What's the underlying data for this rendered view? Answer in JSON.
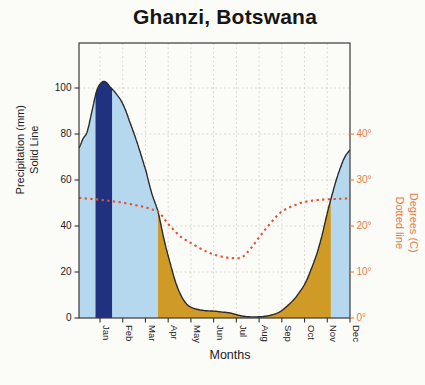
{
  "page": {
    "title": "Ghanzi, Botswana"
  },
  "axes": {
    "left_label_line1": "Precipitation (mm)",
    "left_label_line2": "Solid Line",
    "right_label_line1": "Degrees (C)",
    "right_label_line2": "Dotted line",
    "x_label": "Months"
  },
  "chart_data": {
    "type": "line",
    "title": "Ghanzi, Botswana",
    "subtitle": "Climograph: solid line / blue-gold area = precipitation, dotted line = temperature",
    "categories": [
      "Jan",
      "Feb",
      "Mar",
      "Apr",
      "May",
      "Jun",
      "Jul",
      "Aug",
      "Sep",
      "Oct",
      "Nov",
      "Dec"
    ],
    "series": [
      {
        "name": "Precipitation (mm)",
        "style": "solid-area",
        "values": [
          102,
          93,
          64,
          25,
          4,
          3,
          1,
          1,
          3,
          15,
          45,
          73
        ]
      },
      {
        "name": "Temperature (C)",
        "style": "dotted",
        "values": [
          25.7,
          25.1,
          24.1,
          20.5,
          16.3,
          13.8,
          13.0,
          17.5,
          23.0,
          25.2,
          25.8,
          26.0
        ]
      }
    ],
    "y_left": {
      "label": "Precipitation (mm) Solid Line",
      "ticks": [
        0,
        20,
        40,
        60,
        80,
        100
      ],
      "range_mm": [
        0,
        119.5
      ]
    },
    "y_right": {
      "label": "Degrees (C) Dotted line",
      "tick_labels": [
        "0°",
        "10°",
        "20°",
        "30°",
        "40°"
      ],
      "tick_values_c": [
        0,
        10,
        20,
        30,
        40
      ],
      "range_c": [
        0,
        59.8
      ]
    },
    "xlabel": "Months",
    "grid": "dotted, vertical at each month and horizontal every 20 mm",
    "legend_position": "axis labels serve as legend",
    "solid_curve_points": [
      [
        0.0,
        74
      ],
      [
        0.015,
        78
      ],
      [
        0.03,
        81
      ],
      [
        0.048,
        90
      ],
      [
        0.066,
        99
      ],
      [
        0.085,
        102.5
      ],
      [
        0.1,
        102.5
      ],
      [
        0.114,
        100.5
      ],
      [
        0.137,
        97.5
      ],
      [
        0.162,
        93
      ],
      [
        0.188,
        85
      ],
      [
        0.218,
        75
      ],
      [
        0.247,
        64
      ],
      [
        0.269,
        54
      ],
      [
        0.292,
        46
      ],
      [
        0.314,
        34
      ],
      [
        0.336,
        24
      ],
      [
        0.358,
        15
      ],
      [
        0.38,
        9
      ],
      [
        0.402,
        5.5
      ],
      [
        0.428,
        4
      ],
      [
        0.465,
        3.2
      ],
      [
        0.498,
        3
      ],
      [
        0.528,
        2.6
      ],
      [
        0.557,
        2.2
      ],
      [
        0.583,
        1.4
      ],
      [
        0.605,
        0.8
      ],
      [
        0.631,
        0.5
      ],
      [
        0.66,
        0.5
      ],
      [
        0.69,
        0.8
      ],
      [
        0.72,
        1.6
      ],
      [
        0.745,
        3
      ],
      [
        0.771,
        5.5
      ],
      [
        0.797,
        8.5
      ],
      [
        0.815,
        11.5
      ],
      [
        0.834,
        15
      ],
      [
        0.856,
        21
      ],
      [
        0.878,
        28
      ],
      [
        0.897,
        36
      ],
      [
        0.915,
        45
      ],
      [
        0.93,
        52
      ],
      [
        0.948,
        59.5
      ],
      [
        0.967,
        66
      ],
      [
        0.981,
        70
      ],
      [
        0.993,
        72
      ],
      [
        1.0,
        73
      ]
    ],
    "dotted_curve_points": [
      [
        0.0,
        26.1
      ],
      [
        0.041,
        25.9
      ],
      [
        0.078,
        25.7
      ],
      [
        0.118,
        25.4
      ],
      [
        0.159,
        25.1
      ],
      [
        0.203,
        24.6
      ],
      [
        0.244,
        24.1
      ],
      [
        0.269,
        23.6
      ],
      [
        0.292,
        23.1
      ],
      [
        0.328,
        20.5
      ],
      [
        0.373,
        17.8
      ],
      [
        0.413,
        16.3
      ],
      [
        0.458,
        14.8
      ],
      [
        0.498,
        13.8
      ],
      [
        0.539,
        13.2
      ],
      [
        0.579,
        13.0
      ],
      [
        0.601,
        13.2
      ],
      [
        0.624,
        14.5
      ],
      [
        0.664,
        17.5
      ],
      [
        0.705,
        20.5
      ],
      [
        0.745,
        23.0
      ],
      [
        0.786,
        24.3
      ],
      [
        0.83,
        25.2
      ],
      [
        0.871,
        25.6
      ],
      [
        0.915,
        25.8
      ],
      [
        0.956,
        25.9
      ],
      [
        1.0,
        26.0
      ]
    ],
    "jan_bar": {
      "x_frac_start": 0.061,
      "x_frac_end": 0.122,
      "meaning": "January precipitation column"
    }
  },
  "colors": {
    "background": "#fbfbf8",
    "light_blue": "#b5d8ee",
    "navy": "#20317f",
    "gold": "#cf9b26",
    "temp_line": "#e8502b",
    "temp_text": "#ec7c46",
    "curve": "#2b2b2b",
    "frame": "#3a3a3a",
    "grid": "#d8d6ca",
    "text": "#1c1c1c"
  }
}
